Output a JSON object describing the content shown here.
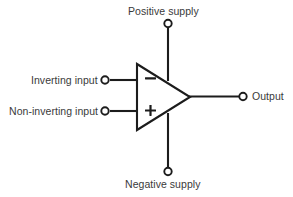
{
  "diagram": {
    "type": "circuit-schematic",
    "background_color": "#ffffff",
    "line_color": "#1c1c1c",
    "text_color": "#3a3a3a",
    "labels": {
      "inverting_input": "Inverting input",
      "non_inverting_input": "Non-inverting input",
      "positive_supply": "Positive supply",
      "negative_supply": "Negative supply",
      "output": "Output"
    },
    "polarity": {
      "minus": "–",
      "plus": "+"
    },
    "terminals": [
      {
        "name": "inverting-input-terminal",
        "x": 105,
        "y": 80
      },
      {
        "name": "non-inverting-input-terminal",
        "x": 105,
        "y": 111
      },
      {
        "name": "positive-supply-terminal",
        "x": 168,
        "y": 23
      },
      {
        "name": "negative-supply-terminal",
        "x": 168,
        "y": 172
      },
      {
        "name": "output-terminal",
        "x": 243,
        "y": 96
      }
    ],
    "amplifier_body": {
      "shape": "triangle",
      "left_edge_x": 136,
      "top_y": 64,
      "bottom_y": 130,
      "apex_x": 190,
      "apex_y": 97
    }
  }
}
